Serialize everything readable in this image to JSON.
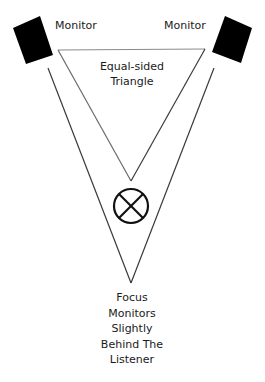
{
  "diagram": {
    "left_monitor_label": "Monitor",
    "right_monitor_label": "Monitor",
    "triangle_label_line1": "Equal-sided",
    "triangle_label_line2": "Triangle",
    "listener_icon": "circle-x-listener-icon",
    "caption_lines": [
      "Focus",
      "Monitors",
      "Slightly",
      "Behind The",
      "Listener"
    ],
    "colors": {
      "monitor": "#000000",
      "line": "#3a3a3a",
      "triangle_line": "#888888",
      "background": "#ffffff"
    }
  }
}
